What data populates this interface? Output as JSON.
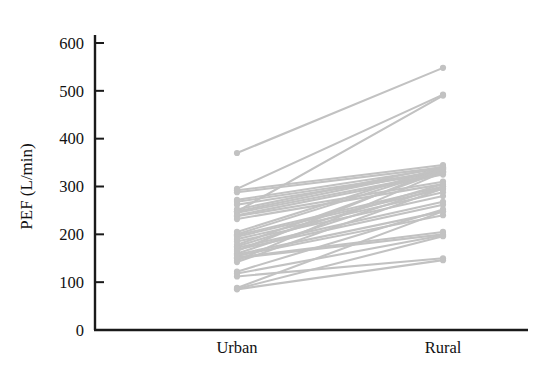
{
  "figure": {
    "background_color": "#ffffff",
    "axis_color": "#1a1a1a",
    "series_color": "#c2c2c2"
  },
  "axes": {
    "y_title": "PEF (L/min)",
    "y_ticks": [
      "0",
      "100",
      "200",
      "300",
      "400",
      "500",
      "600"
    ],
    "x_ticks": [
      "Urban",
      "Rural"
    ]
  },
  "chart_data": {
    "type": "line",
    "subtype": "paired-slope",
    "title": "",
    "xlabel": "",
    "ylabel": "PEF (L/min)",
    "categories": [
      "Urban",
      "Rural"
    ],
    "ylim": [
      0,
      620
    ],
    "yticks": [
      0,
      100,
      200,
      300,
      400,
      500,
      600
    ],
    "grid": false,
    "legend": "none",
    "marker": "circle",
    "line_color": "#c2c2c2",
    "pairs": [
      {
        "id": 1,
        "urban": 370,
        "rural": 548
      },
      {
        "id": 2,
        "urban": 295,
        "rural": 492
      },
      {
        "id": 3,
        "urban": 248,
        "rural": 490
      },
      {
        "id": 4,
        "urban": 292,
        "rural": 345
      },
      {
        "id": 5,
        "urban": 288,
        "rural": 340
      },
      {
        "id": 6,
        "urban": 272,
        "rural": 338
      },
      {
        "id": 7,
        "urban": 268,
        "rural": 332
      },
      {
        "id": 8,
        "urban": 262,
        "rural": 330
      },
      {
        "id": 9,
        "urban": 252,
        "rural": 342
      },
      {
        "id": 10,
        "urban": 248,
        "rural": 336
      },
      {
        "id": 11,
        "urban": 245,
        "rural": 328
      },
      {
        "id": 12,
        "urban": 240,
        "rural": 325
      },
      {
        "id": 13,
        "urban": 238,
        "rural": 310
      },
      {
        "id": 14,
        "urban": 232,
        "rural": 305
      },
      {
        "id": 15,
        "urban": 205,
        "rural": 340
      },
      {
        "id": 16,
        "urban": 200,
        "rural": 335
      },
      {
        "id": 17,
        "urban": 198,
        "rural": 300
      },
      {
        "id": 18,
        "urban": 195,
        "rural": 295
      },
      {
        "id": 19,
        "urban": 190,
        "rural": 288
      },
      {
        "id": 20,
        "urban": 185,
        "rural": 280
      },
      {
        "id": 21,
        "urban": 178,
        "rural": 332
      },
      {
        "id": 22,
        "urban": 175,
        "rural": 305
      },
      {
        "id": 23,
        "urban": 172,
        "rural": 268
      },
      {
        "id": 24,
        "urban": 168,
        "rural": 262
      },
      {
        "id": 25,
        "urban": 165,
        "rural": 338
      },
      {
        "id": 26,
        "urban": 160,
        "rural": 300
      },
      {
        "id": 27,
        "urban": 158,
        "rural": 248
      },
      {
        "id": 28,
        "urban": 155,
        "rural": 240
      },
      {
        "id": 29,
        "urban": 152,
        "rural": 205
      },
      {
        "id": 30,
        "urban": 150,
        "rural": 200
      },
      {
        "id": 31,
        "urban": 145,
        "rural": 330
      },
      {
        "id": 32,
        "urban": 142,
        "rural": 296
      },
      {
        "id": 33,
        "urban": 122,
        "rural": 252
      },
      {
        "id": 34,
        "urban": 118,
        "rural": 198
      },
      {
        "id": 35,
        "urban": 112,
        "rural": 150
      },
      {
        "id": 36,
        "urban": 88,
        "rural": 248
      },
      {
        "id": 37,
        "urban": 86,
        "rural": 196
      },
      {
        "id": 38,
        "urban": 85,
        "rural": 146
      }
    ]
  }
}
